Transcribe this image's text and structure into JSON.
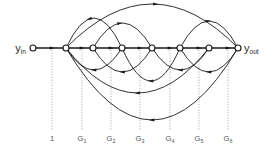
{
  "figure": {
    "name": "signal-flow-graph",
    "width": 278,
    "height": 151,
    "background": "#ffffff",
    "edge_color": "#1a1a1a",
    "guide_color": "#9a9a9a",
    "label_color": "#555555"
  },
  "ports": {
    "input": {
      "base": "y",
      "sub": "in",
      "x": 14,
      "y": 52
    },
    "output": {
      "base": "y",
      "sub": "out",
      "x": 244,
      "y": 52
    }
  },
  "nodes": [
    {
      "id": "n0",
      "x": 33,
      "y": 48,
      "r": 3.0
    },
    {
      "id": "n1",
      "x": 66,
      "y": 48,
      "r": 3.0
    },
    {
      "id": "n2",
      "x": 93,
      "y": 48,
      "r": 3.0
    },
    {
      "id": "n3",
      "x": 122,
      "y": 48,
      "r": 3.0
    },
    {
      "id": "n4",
      "x": 152,
      "y": 48,
      "r": 3.0
    },
    {
      "id": "n5",
      "x": 180,
      "y": 48,
      "r": 3.0
    },
    {
      "id": "n6",
      "x": 209,
      "y": 48,
      "r": 3.0
    },
    {
      "id": "n7",
      "x": 238,
      "y": 48,
      "r": 3.0
    }
  ],
  "guides": [
    {
      "x": 52,
      "label": "1",
      "sub": ""
    },
    {
      "x": 82,
      "label": "G",
      "sub": "1"
    },
    {
      "x": 111,
      "label": "G",
      "sub": "2"
    },
    {
      "x": 140,
      "label": "G",
      "sub": "3"
    },
    {
      "x": 170,
      "label": "G",
      "sub": "4"
    },
    {
      "x": 199,
      "label": "G",
      "sub": "5"
    },
    {
      "x": 228,
      "label": "G",
      "sub": "6"
    }
  ],
  "guide_geometry": {
    "top": 50,
    "bottom": 130,
    "label_y": 141
  },
  "spine": {
    "y": 48,
    "x_start": 33,
    "x_end": 238,
    "arrow_positions": [
      52,
      82,
      111,
      140,
      170,
      199,
      228
    ]
  },
  "forward_arcs": [
    {
      "from": 66,
      "to": 122,
      "rise": 30,
      "arrow_t": 0.42,
      "direction": "backward"
    },
    {
      "from": 93,
      "to": 152,
      "rise": 25,
      "arrow_t": 0.45,
      "direction": "forward"
    },
    {
      "from": 66,
      "to": 238,
      "rise": 44,
      "arrow_t": 0.52,
      "direction": "forward"
    },
    {
      "from": 180,
      "to": 238,
      "rise": 27,
      "arrow_t": 0.48,
      "direction": "forward"
    }
  ],
  "feedback_arcs": [
    {
      "from": 122,
      "to": 66,
      "drop": 22,
      "arrow_t": 0.5
    },
    {
      "from": 152,
      "to": 93,
      "drop": 24,
      "arrow_t": 0.5
    },
    {
      "from": 209,
      "to": 152,
      "drop": 22,
      "arrow_t": 0.5
    },
    {
      "from": 238,
      "to": 180,
      "drop": 24,
      "arrow_t": 0.5
    },
    {
      "from": 209,
      "to": 66,
      "drop": 45,
      "arrow_t": 0.5
    },
    {
      "from": 238,
      "to": 66,
      "drop": 72,
      "arrow_t": 0.5
    },
    {
      "from": 180,
      "to": 122,
      "drop": 33,
      "arrow_t": 0.5
    }
  ]
}
